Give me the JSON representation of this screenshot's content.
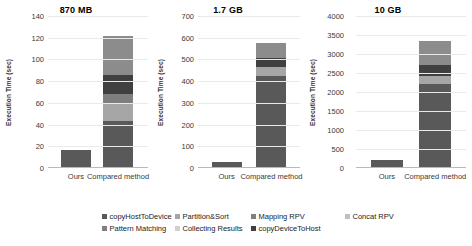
{
  "figure": {
    "ylabel": "Execution Time (sec)",
    "xcategories": [
      "Ours",
      "Compared method"
    ]
  },
  "legend": {
    "items": [
      {
        "label": "copyHostToDevice",
        "color": "#595959"
      },
      {
        "label": "Partition&Sort",
        "color": "#a6a6a6"
      },
      {
        "label": "Mapping RPV",
        "color": "#7f7f7f"
      },
      {
        "label": "Concat RPV",
        "color": "#bfbfbf"
      },
      {
        "label": "Pattern Matching",
        "color": "#808080"
      },
      {
        "label": "Collecting Results",
        "color": "#d0d0d0"
      },
      {
        "label": "copyDeviceToHost",
        "color": "#404040"
      }
    ]
  },
  "chart_data": [
    {
      "type": "bar",
      "title": "870 MB",
      "subtitle": "",
      "xlabel": "",
      "ylabel": "Execution Time (sec)",
      "categories": [
        "Ours",
        "Compared method"
      ],
      "ylim": [
        0,
        140
      ],
      "yticks": [
        0,
        20,
        40,
        60,
        80,
        100,
        120,
        140
      ],
      "grid": true,
      "stacked": true,
      "legend_position": "bottom",
      "series": [
        {
          "name": "copyHostToDevice",
          "color": "#595959",
          "values": [
            16,
            42
          ]
        },
        {
          "name": "Partition&Sort",
          "color": "#a6a6a6",
          "values": [
            0,
            16
          ]
        },
        {
          "name": "Mapping RPV",
          "color": "#7f7f7f",
          "values": [
            0,
            9
          ]
        },
        {
          "name": "Concat RPV",
          "color": "#bfbfbf",
          "values": [
            0,
            0
          ]
        },
        {
          "name": "Pattern Matching",
          "color": "#404040",
          "values": [
            0,
            18
          ]
        },
        {
          "name": "Collecting Results",
          "color": "#8c8c8c",
          "values": [
            0,
            36
          ]
        },
        {
          "name": "copyDeviceToHost",
          "color": "#a6a6a6",
          "values": [
            0,
            0
          ]
        }
      ],
      "totals": [
        16,
        121
      ]
    },
    {
      "type": "bar",
      "title": "1.7 GB",
      "subtitle": "",
      "xlabel": "",
      "ylabel": "Execution Time (sec)",
      "categories": [
        "Ours",
        "Compared method"
      ],
      "ylim": [
        0,
        700
      ],
      "yticks": [
        0,
        100,
        200,
        300,
        400,
        500,
        600,
        700
      ],
      "grid": true,
      "stacked": true,
      "legend_position": "bottom",
      "series": [
        {
          "name": "copyHostToDevice",
          "color": "#595959",
          "values": [
            25,
            420
          ]
        },
        {
          "name": "Partition&Sort",
          "color": "#a6a6a6",
          "values": [
            0,
            40
          ]
        },
        {
          "name": "Mapping RPV",
          "color": "#7f7f7f",
          "values": [
            0,
            0
          ]
        },
        {
          "name": "Concat RPV",
          "color": "#bfbfbf",
          "values": [
            0,
            0
          ]
        },
        {
          "name": "Pattern Matching",
          "color": "#404040",
          "values": [
            0,
            40
          ]
        },
        {
          "name": "Collecting Results",
          "color": "#8c8c8c",
          "values": [
            0,
            70
          ]
        },
        {
          "name": "copyDeviceToHost",
          "color": "#a6a6a6",
          "values": [
            0,
            0
          ]
        }
      ],
      "totals": [
        25,
        570
      ]
    },
    {
      "type": "bar",
      "title": "10 GB",
      "subtitle": "",
      "xlabel": "",
      "ylabel": "Execution Time (sec)",
      "categories": [
        "Ours",
        "Compared method"
      ],
      "ylim": [
        0,
        4000
      ],
      "yticks": [
        0,
        500,
        1000,
        1500,
        2000,
        2500,
        3000,
        3500,
        4000
      ],
      "grid": true,
      "stacked": true,
      "legend_position": "bottom",
      "series": [
        {
          "name": "copyHostToDevice",
          "color": "#595959",
          "values": [
            175,
            2175
          ]
        },
        {
          "name": "Partition&Sort",
          "color": "#a6a6a6",
          "values": [
            0,
            230
          ]
        },
        {
          "name": "Mapping RPV",
          "color": "#7f7f7f",
          "values": [
            0,
            0
          ]
        },
        {
          "name": "Concat RPV",
          "color": "#bfbfbf",
          "values": [
            0,
            0
          ]
        },
        {
          "name": "Pattern Matching",
          "color": "#404040",
          "values": [
            0,
            270
          ]
        },
        {
          "name": "Collecting Results",
          "color": "#8c8c8c",
          "values": [
            0,
            650
          ]
        },
        {
          "name": "copyDeviceToHost",
          "color": "#a6a6a6",
          "values": [
            0,
            0
          ]
        }
      ],
      "totals": [
        175,
        3325
      ]
    }
  ]
}
